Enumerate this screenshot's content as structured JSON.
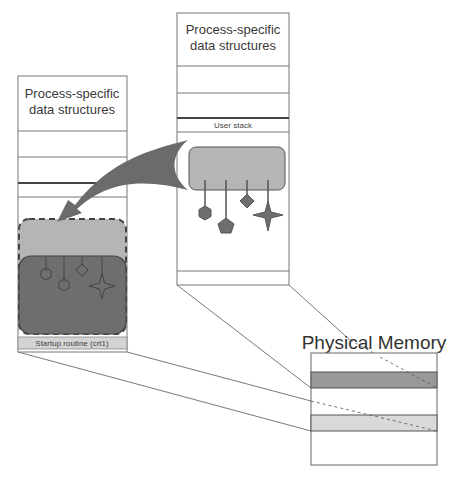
{
  "diagram": {
    "type": "memory-mapping",
    "right_process": {
      "title_line1": "Process-specific",
      "title_line2": "data structures",
      "user_stack_label": "User stack"
    },
    "left_process": {
      "title_line1": "Process-specific",
      "title_line2": "data structures",
      "startup_label": "Startup routine (crt1)"
    },
    "physical_memory": {
      "title": "Physical Memory"
    },
    "colors": {
      "dark_region": "#6e6e6e",
      "medium_region": "#b5b5b5",
      "light_region": "#d9d9d9",
      "arrow": "#6b6b6b",
      "outline": "#555555"
    }
  }
}
